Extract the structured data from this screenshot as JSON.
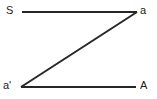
{
  "figure": {
    "background_color": "#ffffff",
    "stroke_color": "#262626",
    "stroke_width": 2.2
  },
  "labels": {
    "top_left": "S",
    "top_right": "a",
    "bottom_left": "a'",
    "bottom_right": "A"
  },
  "chart_data": {
    "type": "line",
    "xlabel": "",
    "ylabel": "",
    "xlim": [
      0,
      157
    ],
    "ylim": [
      99,
      0
    ],
    "grid": false,
    "legend": "none",
    "series": [
      {
        "name": "top-segment",
        "points": [
          [
            22,
            12
          ],
          [
            137,
            12
          ]
        ]
      },
      {
        "name": "diagonal-segment",
        "points": [
          [
            137,
            12
          ],
          [
            21,
            87
          ]
        ]
      },
      {
        "name": "bottom-segment",
        "points": [
          [
            21,
            87
          ],
          [
            136,
            87
          ]
        ]
      }
    ],
    "annotations": [
      {
        "text": "S",
        "x": 10,
        "y": 11
      },
      {
        "text": "a",
        "x": 144,
        "y": 11
      },
      {
        "text": "a'",
        "x": 7,
        "y": 86
      },
      {
        "text": "A",
        "x": 144,
        "y": 86
      }
    ]
  }
}
